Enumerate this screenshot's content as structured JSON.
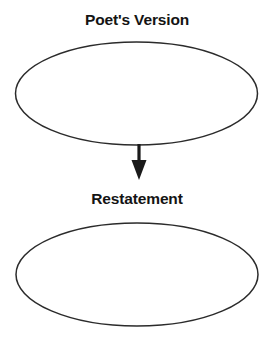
{
  "diagram": {
    "type": "flow-diagram",
    "orientation": "vertical",
    "background_color": "#ffffff",
    "stroke_color": "#2b2b2b",
    "text_color": "#141414",
    "arrow_color": "#1a1a1a",
    "nodes": [
      {
        "id": "poets-version",
        "label": "Poet's Version",
        "shape": "ellipse",
        "fill": "none"
      },
      {
        "id": "restatement",
        "label": "Restatement",
        "shape": "ellipse",
        "fill": "none"
      }
    ],
    "connectors": [
      {
        "id": "poets-version-to-restatement",
        "from": "poets-version",
        "to": "restatement",
        "style": "solid",
        "arrowhead": "filled-triangle",
        "direction": "down"
      }
    ]
  }
}
